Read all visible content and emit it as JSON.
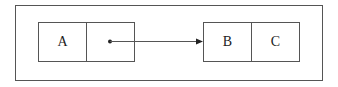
{
  "diagram": {
    "left_node": {
      "value_label": "A",
      "pointer_label": ""
    },
    "right_node": {
      "cells": [
        "B",
        "C"
      ]
    },
    "edge": {
      "from": "left_node.pointer",
      "to": "right_node",
      "type": "arrow"
    },
    "colors": {
      "stroke": "#555555",
      "text": "#222222",
      "background": "#ffffff"
    }
  }
}
